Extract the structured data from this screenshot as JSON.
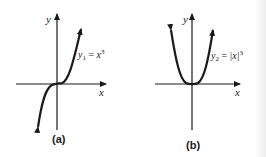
{
  "figure": {
    "panels": [
      {
        "id": "a",
        "caption": "(a)",
        "x_axis_label": "x",
        "y_axis_label": "y",
        "function_label": {
          "name": "y",
          "subscript": "1",
          "equals": " = ",
          "expr": "x",
          "power": "3"
        },
        "function": "y1 = x^3",
        "curve_shape": "cubic"
      },
      {
        "id": "b",
        "caption": "(b)",
        "x_axis_label": "x",
        "y_axis_label": "y",
        "function_label": {
          "name": "y",
          "subscript": "2",
          "equals": " = ",
          "expr": "|x|",
          "power": "3"
        },
        "function": "y2 = |x|^3",
        "curve_shape": "absolute-cubic"
      }
    ],
    "colors": {
      "ink": "#1a1a1a",
      "background": "#ffffff"
    }
  }
}
